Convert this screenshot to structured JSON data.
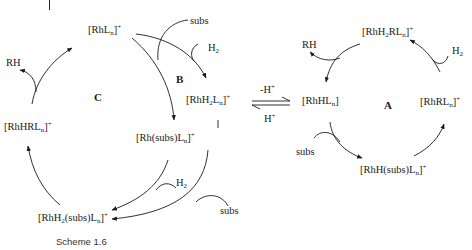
{
  "caption": "Scheme 1.6",
  "cycles": {
    "A": "A",
    "B": "B",
    "C": "C"
  },
  "species": {
    "rhln": "[RhL",
    "rhh2ln": "[RhH",
    "rhsubsln": "[Rh(subs)L",
    "rhh2subsln": "[RhH",
    "rhhrln_left": "[RhHRL",
    "rhhln": "[RhHL",
    "rhh2rln": "[RhH",
    "rhrln": "[RhRL",
    "rhhsubsln": "[RhH(subs)L"
  },
  "reagents": {
    "subs_top": "subs",
    "h2_top": "H",
    "rh_left": "RH",
    "h2_bottom_left": "H",
    "subs_bottom": "subs",
    "rh_right": "RH",
    "h2_right": "H",
    "subs_right": "subs",
    "minus_h": "-H",
    "plus_h": "H"
  },
  "sub": {
    "n": "n",
    "two": "2"
  },
  "sup": {
    "plus": "+"
  }
}
